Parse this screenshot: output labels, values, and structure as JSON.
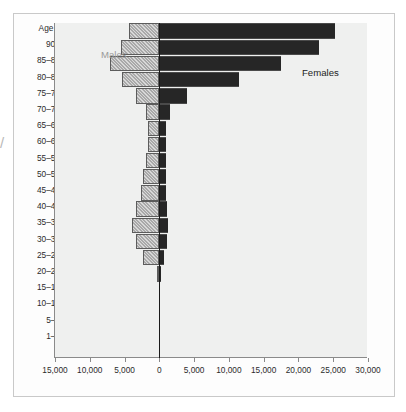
{
  "chart_data": {
    "type": "bar",
    "subtype": "population-pyramid",
    "title": "",
    "xlabel": "",
    "ylabel": "Age",
    "orientation": "horizontal",
    "grid": false,
    "legend_position": "in-plot",
    "axis_title_y": "Age",
    "xlim": [
      -15000,
      30000
    ],
    "x_ticks": [
      15000,
      10000,
      5000,
      0,
      5000,
      10000,
      15000,
      20000,
      25000,
      30000
    ],
    "x_tick_labels": [
      "15,000",
      "10,000",
      "5,000",
      "0",
      "5,000",
      "10,000",
      "15,000",
      "20,000",
      "25,000",
      "30,000"
    ],
    "x_tick_unit_step": 5000,
    "categories": [
      "0",
      "1–4",
      "5–9",
      "10–14",
      "15–19",
      "20–24",
      "25–29",
      "30–34",
      "35–39",
      "40–44",
      "45–49",
      "50–54",
      "55–59",
      "60–64",
      "65–69",
      "70–74",
      "75–79",
      "80–84",
      "85–89",
      "90+"
    ],
    "series": [
      {
        "name": "Males",
        "color": "#a9a9a9",
        "pattern": "diagonal-hatch",
        "side": "left",
        "values": [
          0,
          0,
          0,
          0,
          300,
          2400,
          3400,
          3900,
          3300,
          2600,
          2300,
          1900,
          1700,
          1700,
          1900,
          3400,
          5300,
          7100,
          5500,
          4300
        ]
      },
      {
        "name": "Females",
        "color": "#262626",
        "pattern": "solid",
        "side": "right",
        "values": [
          0,
          0,
          0,
          0,
          200,
          700,
          1100,
          1300,
          1100,
          900,
          900,
          900,
          900,
          1000,
          1600,
          4000,
          11500,
          17500,
          23000,
          25300
        ]
      }
    ],
    "annotations": [
      {
        "text": "Males",
        "color": "#9a9a9a"
      },
      {
        "text": "Females",
        "color": "#232323"
      }
    ]
  },
  "labels": {
    "age_title": "Age",
    "males": "Males",
    "females": "Females",
    "edge_mark": "/"
  }
}
